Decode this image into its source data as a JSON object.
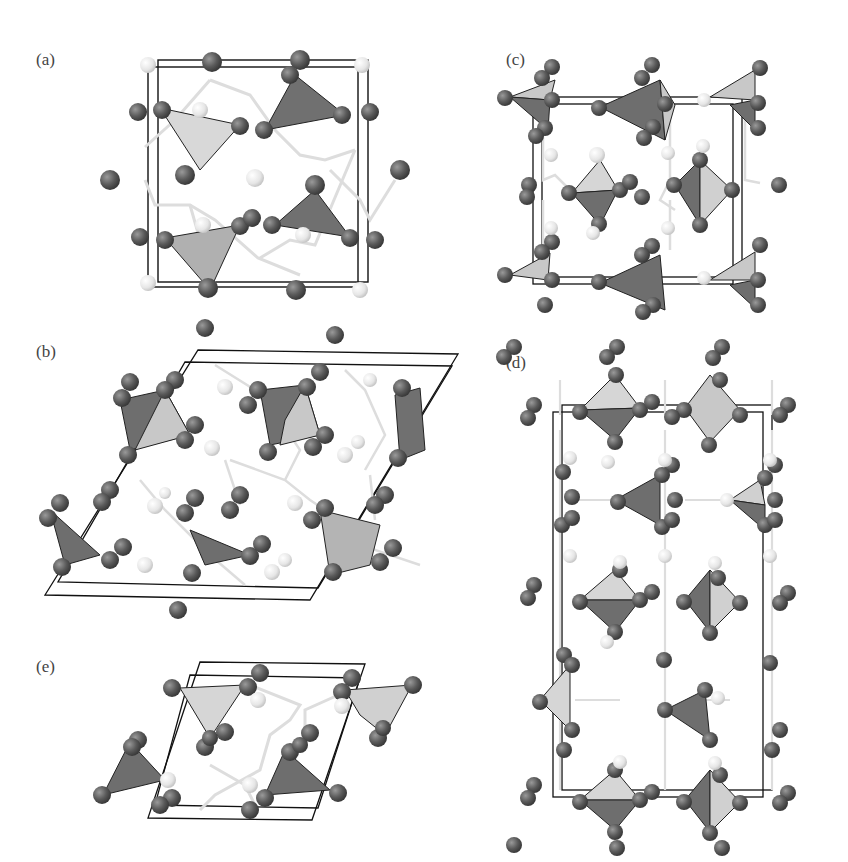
{
  "figure": {
    "panels": [
      {
        "id": "a",
        "label": "(a)"
      },
      {
        "id": "b",
        "label": "(b)"
      },
      {
        "id": "c",
        "label": "(c)"
      },
      {
        "id": "d",
        "label": "(d)"
      },
      {
        "id": "e",
        "label": "(e)"
      }
    ],
    "colors": {
      "dark_atom": "#5a5a5a",
      "light_atom": "#e8e8e8",
      "dark_polyhedron": "#6e6e6e",
      "light_polyhedron": "#cfcfcf",
      "cell_edge": "#111111",
      "bond": "#dddddd"
    }
  }
}
